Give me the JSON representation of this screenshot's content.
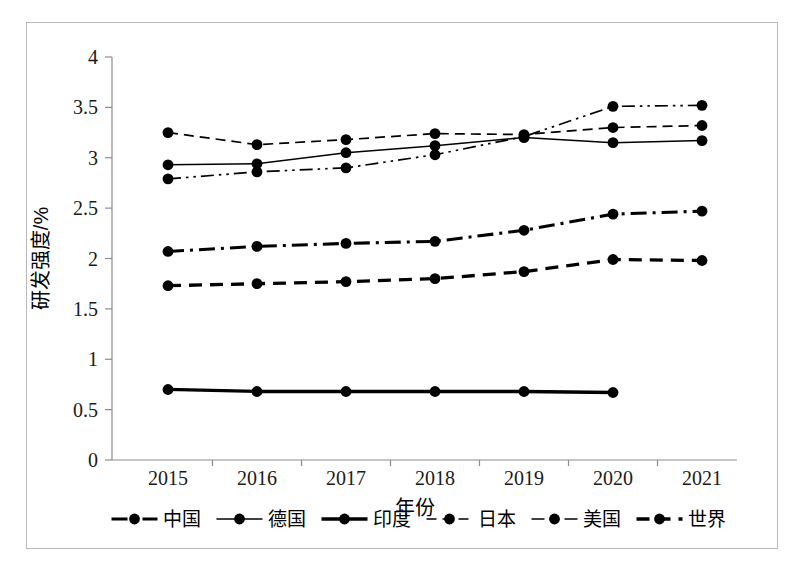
{
  "chart_data": {
    "type": "line",
    "title": "",
    "xlabel": "年份",
    "ylabel": "研发强度/%",
    "x": [
      2015,
      2016,
      2017,
      2018,
      2019,
      2020,
      2021
    ],
    "categories": [
      "2015",
      "2016",
      "2017",
      "2018",
      "2019",
      "2020",
      "2021"
    ],
    "xtick_labels": [
      "2015",
      "2016",
      "2017",
      "2018",
      "2019",
      "2020",
      "2021"
    ],
    "ytick_labels": [
      "0",
      "0.5",
      "1",
      "1.5",
      "2",
      "2.5",
      "3",
      "3.5",
      "4"
    ],
    "ytick_values": [
      0,
      0.5,
      1,
      1.5,
      2,
      2.5,
      3,
      3.5,
      4
    ],
    "ylim": [
      0,
      4
    ],
    "xlim": [
      2015,
      2021
    ],
    "grid": false,
    "legend_position": "bottom",
    "series": [
      {
        "name": "中国",
        "values": [
          2.07,
          2.12,
          2.15,
          2.17,
          2.28,
          2.44,
          2.47
        ],
        "line_style": "dash-dot",
        "line_width": 3.1,
        "color": "#000000",
        "marker": "circle",
        "marker_size": 5.4
      },
      {
        "name": "德国",
        "values": [
          2.93,
          2.94,
          3.05,
          3.12,
          3.2,
          3.15,
          3.17
        ],
        "line_style": "solid",
        "line_width": 1.5,
        "color": "#000000",
        "marker": "circle",
        "marker_size": 5.4
      },
      {
        "name": "印度",
        "values": [
          0.7,
          0.68,
          0.68,
          0.68,
          0.68,
          0.67,
          null
        ],
        "line_style": "solid",
        "line_width": 3.3,
        "color": "#000000",
        "marker": "circle",
        "marker_size": 5.4
      },
      {
        "name": "日本",
        "values": [
          3.25,
          3.13,
          3.18,
          3.24,
          3.23,
          3.3,
          3.32
        ],
        "line_style": "dashed",
        "line_width": 1.7,
        "color": "#000000",
        "marker": "circle",
        "marker_size": 5.4
      },
      {
        "name": "美国",
        "values": [
          2.79,
          2.86,
          2.9,
          3.03,
          3.21,
          3.51,
          3.52
        ],
        "line_style": "dash-dot-dot",
        "line_width": 1.7,
        "color": "#000000",
        "marker": "circle",
        "marker_size": 5.4
      },
      {
        "name": "世界",
        "values": [
          1.73,
          1.75,
          1.77,
          1.8,
          1.87,
          1.99,
          1.98
        ],
        "line_style": "dashed-bold",
        "line_width": 3.3,
        "color": "#000000",
        "marker": "circle",
        "marker_size": 5.4
      }
    ],
    "legend": [
      {
        "label": "中国",
        "line_style": "dash-dot",
        "line_width": 3.1
      },
      {
        "label": "德国",
        "line_style": "solid",
        "line_width": 1.5
      },
      {
        "label": "印度",
        "line_style": "solid",
        "line_width": 3.3
      },
      {
        "label": "日本",
        "line_style": "dashed",
        "line_width": 1.7
      },
      {
        "label": "美国",
        "line_style": "dash-dot-dot",
        "line_width": 1.7
      },
      {
        "label": "世界",
        "line_style": "dashed-bold",
        "line_width": 3.3
      }
    ]
  },
  "figure": {
    "frame_color": "#b9b9b9",
    "axis_color": "#8d8d8d",
    "background": "#ffffff"
  }
}
